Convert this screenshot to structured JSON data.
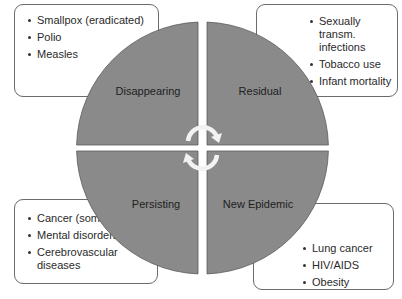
{
  "diagram": {
    "quadrants": [
      {
        "id": "top-left",
        "label": "Disappearing"
      },
      {
        "id": "top-right",
        "label": "Residual"
      },
      {
        "id": "bottom-left",
        "label": "Persisting"
      },
      {
        "id": "bottom-right",
        "label": "New Epidemic"
      }
    ],
    "boxes": {
      "top_left": {
        "items": [
          "Smallpox (eradicated)",
          "Polio",
          "Measles"
        ]
      },
      "top_right": {
        "items": [
          "Sexually transm. infections",
          "Tobacco use",
          "Infant mortality"
        ]
      },
      "bottom_left": {
        "items": [
          "Cancer (some forms)",
          "Mental disorders",
          "Cerebrovascular diseases"
        ]
      },
      "bottom_right": {
        "items": [
          "Lung cancer",
          "HIV/AIDS",
          "Obesity"
        ]
      }
    },
    "center_icon": "cycle-arrows-icon",
    "colors": {
      "quadrant_fill": "#8a8a8a",
      "quadrant_edge": "#555555",
      "arrow": "#f2f2f2",
      "box_border": "#6b6b6b"
    }
  }
}
